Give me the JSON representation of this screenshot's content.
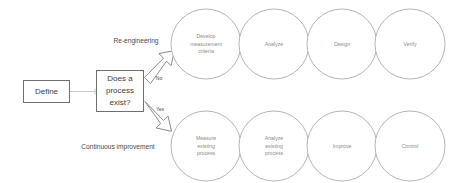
{
  "diagram": {
    "colors": {
      "circle_stroke": "#b5b5b5",
      "chevron_fill": "#a9a9a9",
      "box_stroke": "#6f6f6f",
      "connector": "#c9c9c9",
      "circle_text": "#8c8c8c",
      "box_text": "#3d3d3d",
      "background": "#ffffff"
    },
    "start": {
      "label": "Define"
    },
    "decision": {
      "line1": "Does a",
      "line2": "process",
      "line3": "exist?",
      "full_text": "Does a process exist?"
    },
    "branches": {
      "no_label": "No",
      "yes_label": "Yes"
    },
    "paths": [
      {
        "name": "re-engineering",
        "label": "Re-engineering",
        "steps": [
          {
            "id": "develop-measurement-criteria",
            "lines": [
              "Develop",
              "measurement",
              "criteria"
            ]
          },
          {
            "id": "analyze",
            "lines": [
              "Analyze"
            ]
          },
          {
            "id": "design",
            "lines": [
              "Design"
            ]
          },
          {
            "id": "verify",
            "lines": [
              "Verify"
            ]
          }
        ]
      },
      {
        "name": "continuous-improvement",
        "label": "Continuous improvement",
        "steps": [
          {
            "id": "measure-existing-process",
            "lines": [
              "Measure",
              "existing",
              "process"
            ]
          },
          {
            "id": "analyze-existing-process",
            "lines": [
              "Analyze",
              "existing",
              "process"
            ]
          },
          {
            "id": "improve",
            "lines": [
              "Improve"
            ]
          },
          {
            "id": "control",
            "lines": [
              "Control"
            ]
          }
        ]
      }
    ]
  }
}
